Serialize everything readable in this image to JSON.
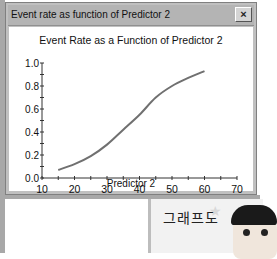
{
  "window": {
    "title": "Event rate as function of Predictor 2",
    "close_label": "×"
  },
  "chart_data": {
    "type": "line",
    "title": "Event Rate as a Function of Predictor 2",
    "xlabel": "Predictor 2",
    "ylabel": "",
    "xlim": [
      10,
      70
    ],
    "ylim": [
      0.0,
      1.0
    ],
    "x_ticks": [
      "10",
      "20",
      "30",
      "40",
      "50",
      "60",
      "70"
    ],
    "y_ticks": [
      "0.0",
      "0.2",
      "0.4",
      "0.6",
      "0.8",
      "1.0"
    ],
    "grid": false,
    "legend": null,
    "series": [
      {
        "name": "Event rate",
        "color": "#707070",
        "x": [
          15,
          20,
          25,
          30,
          35,
          40,
          45,
          50,
          55,
          60
        ],
        "y": [
          0.07,
          0.12,
          0.19,
          0.29,
          0.42,
          0.55,
          0.7,
          0.8,
          0.87,
          0.93
        ]
      }
    ]
  },
  "overlay": {
    "banner_text": "그래프도"
  }
}
